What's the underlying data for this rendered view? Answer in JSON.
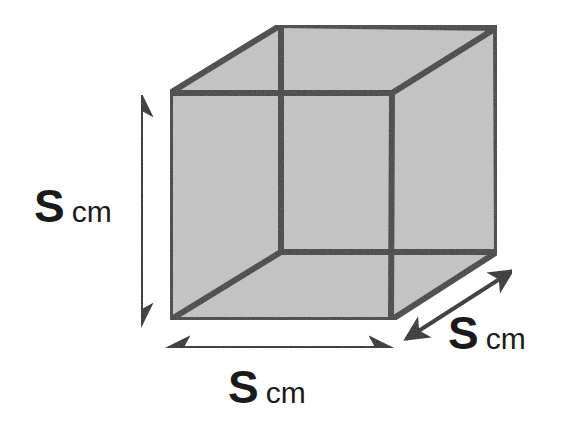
{
  "figure": {
    "shape": "cube",
    "background_color": "#ffffff",
    "face_fill_color": "#c4c4c4",
    "edge_color": "#3f3f3f",
    "arrow_color": "#262626",
    "text_color": "#1a1a1a",
    "edge_width_px": 6,
    "arrow_width_px": 4,
    "projection": "oblique",
    "vertices": {
      "front_top_left": [
        170,
        93
      ],
      "front_top_right": [
        392,
        93
      ],
      "front_bottom_right": [
        391,
        320
      ],
      "front_bottom_left": [
        170,
        320
      ],
      "back_top_left": [
        281,
        25
      ],
      "back_top_right": [
        496,
        28
      ],
      "back_bottom_right": [
        497,
        252
      ],
      "back_bottom_left": [
        281,
        252
      ]
    }
  },
  "labels": {
    "height": {
      "symbol": "S",
      "unit": "cm"
    },
    "width": {
      "symbol": "S",
      "unit": "cm"
    },
    "depth": {
      "symbol": "S",
      "unit": "cm"
    }
  },
  "dimension_arrows": {
    "height": {
      "orientation": "vertical",
      "double_headed": true,
      "x": 141,
      "y_start": 95,
      "y_end": 325
    },
    "width": {
      "orientation": "horizontal",
      "double_headed": true,
      "y": 348,
      "x_start": 168,
      "x_end": 391
    },
    "depth": {
      "orientation": "diagonal",
      "double_headed": true,
      "x_start": 406,
      "y_start": 339,
      "x_end": 512,
      "y_end": 271
    }
  }
}
